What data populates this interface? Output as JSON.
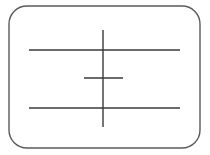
{
  "document": {
    "type": "line-drawing",
    "title": "Rounded rectangle frame with crossed lines",
    "width": 210,
    "height": 155,
    "background_color": "#ffffff",
    "has_text": false
  },
  "palette": {
    "background": "#ffffff",
    "frame_stroke": "#5a5a5a",
    "line_stroke": "#3a3a3a"
  },
  "shapes": {
    "frame": {
      "name": "rounded-rectangle-frame",
      "x": 9,
      "y": 6,
      "width": 191,
      "height": 142,
      "corner_radius": 18,
      "stroke": "#5a5a5a",
      "stroke_width": 1.4,
      "fill": "none"
    },
    "vertical_line": {
      "name": "vertical-stroke",
      "x1": 103,
      "y1": 30,
      "x2": 103,
      "y2": 127,
      "stroke": "#3a3a3a",
      "stroke_width": 1.4
    },
    "horizontal_lines": [
      {
        "name": "upper-horizontal-stroke",
        "x1": 29,
        "y1": 50,
        "x2": 180,
        "y2": 50,
        "stroke": "#3a3a3a",
        "stroke_width": 1.4,
        "length": 151
      },
      {
        "name": "middle-short-horizontal-stroke",
        "x1": 84,
        "y1": 78,
        "x2": 123,
        "y2": 78,
        "stroke": "#3a3a3a",
        "stroke_width": 1.4,
        "length": 39
      },
      {
        "name": "lower-horizontal-stroke",
        "x1": 29,
        "y1": 108,
        "x2": 180,
        "y2": 108,
        "stroke": "#3a3a3a",
        "stroke_width": 1.4,
        "length": 151
      }
    ]
  }
}
